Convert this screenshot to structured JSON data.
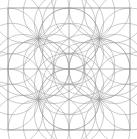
{
  "figure": {
    "canvas": {
      "width": 137,
      "height": 139
    },
    "background_color": "#ffffff"
  },
  "style": {
    "line_color": "#9a9a9a",
    "frame_color": "#8c8c8c",
    "grid_color": "#9e9e9e",
    "circle_color": "#a2a2a2",
    "frame_stroke_width": 0.8,
    "grid_stroke_width": 0.7,
    "circle_stroke_width": 0.55
  },
  "frame": {
    "x": 8,
    "y": 8,
    "width": 122,
    "height": 122,
    "label": "outer-square-frame"
  },
  "grid": {
    "columns": 2,
    "rows": 2,
    "vertical_lines": [
      69
    ],
    "horizontal_lines": [
      69
    ],
    "cell_width": 61,
    "cell_height": 61
  },
  "rosettes": [
    {
      "name": "rosette-top-left",
      "cx": 38.5,
      "cy": 38.5,
      "radius": 30.5,
      "petals": 12
    },
    {
      "name": "rosette-top-right",
      "cx": 99.5,
      "cy": 38.5,
      "radius": 30.5,
      "petals": 12
    },
    {
      "name": "rosette-bottom-left",
      "cx": 38.5,
      "cy": 99.5,
      "radius": 30.5,
      "petals": 12
    },
    {
      "name": "rosette-bottom-right",
      "cx": 99.5,
      "cy": 99.5,
      "radius": 30.5,
      "petals": 12
    }
  ],
  "chart_data": {
    "type": "scatter",
    "subtitle": "",
    "xlabel": "",
    "ylabel": "",
    "xlim": [
      8,
      130
    ],
    "ylim": [
      8,
      130
    ],
    "grid": true,
    "legend": "none",
    "tick_labels_x": [],
    "tick_labels_y": [],
    "annotations": [],
    "series": [
      {
        "name": "rosette-centers",
        "x": [
          38.5,
          99.5,
          38.5,
          99.5
        ],
        "y": [
          38.5,
          38.5,
          99.5,
          99.5
        ]
      }
    ],
    "construction": {
      "unit_cell": 61,
      "circles_per_rosette": 12,
      "circle_radius": 30.5,
      "satellite_orbit_radius": 30.5,
      "total_circles": 48
    }
  }
}
